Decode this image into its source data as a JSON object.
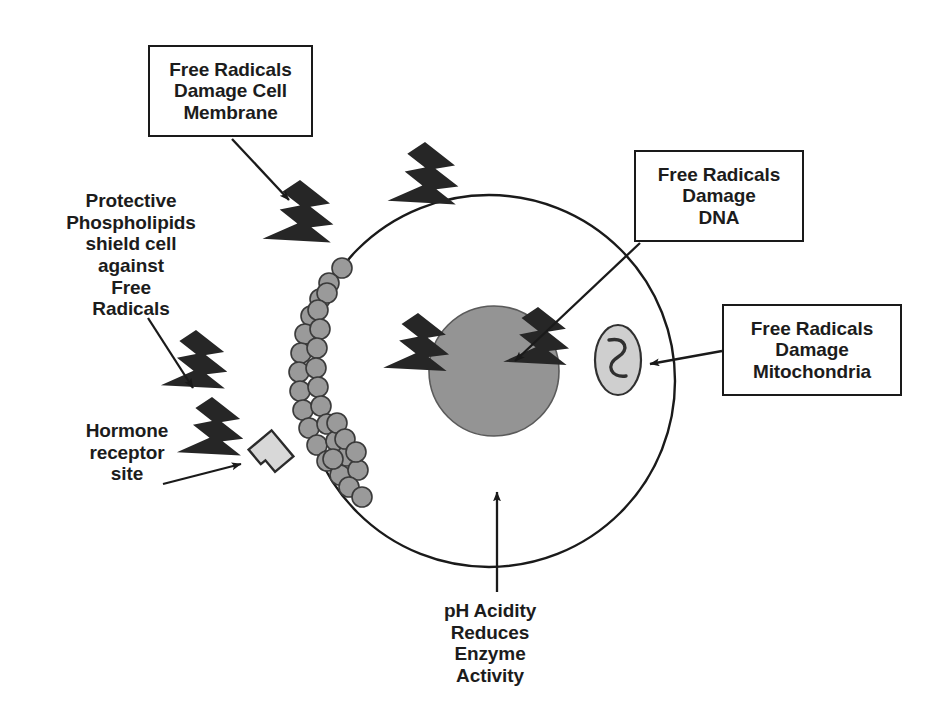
{
  "diagram": {
    "background_color": "#ffffff",
    "stroke_color": "#1a1a1a",
    "text_color": "#1c1c1c",
    "bolt_color": "#262626",
    "nucleus_color": "#949494",
    "phospholipid_color": "#9a9a9a",
    "mitochondria_color": "#cfcfcf",
    "receptor_color": "#d8d8d8"
  },
  "callouts": {
    "membrane": {
      "lines": [
        "Free Radicals",
        "Damage Cell",
        "Membrane"
      ]
    },
    "dna": {
      "lines": [
        "Free Radicals",
        "Damage",
        "DNA"
      ]
    },
    "mitochondria": {
      "lines": [
        "Free Radicals",
        "Damage",
        "Mitochondria"
      ]
    }
  },
  "labels": {
    "phospholipids": {
      "lines": [
        "Protective",
        "Phospholipids",
        "shield cell",
        "against",
        "Free",
        "Radicals"
      ]
    },
    "hormone_receptor": {
      "lines": [
        "Hormone",
        "receptor",
        "site"
      ]
    },
    "ph_acidity": {
      "lines": [
        "pH Acidity",
        "Reduces",
        "Enzyme",
        "Activity"
      ]
    }
  },
  "structures": {
    "cell_membrane": "cell-membrane-circle",
    "nucleus": "nucleus",
    "mitochondrion": "mitochondrion",
    "receptor": "hormone-receptor-site",
    "phospholipid_layer": "phospholipid-bilayer"
  },
  "free_radicals": {
    "bolt_count": 6,
    "label": "free-radical-lightning-bolt"
  }
}
